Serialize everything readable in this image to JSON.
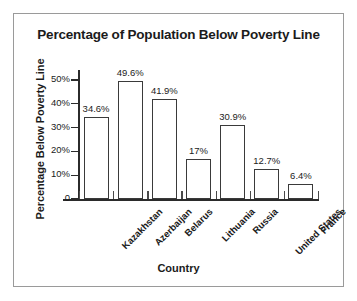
{
  "chart_data": {
    "type": "bar",
    "title": "Percentage of Population Below Poverty Line",
    "xlabel": "Country",
    "ylabel": "Percentage Below Poverty Line",
    "categories": [
      "Kazakhstan",
      "Azerbaijan",
      "Belarus",
      "Lithuania",
      "Russia",
      "United States",
      "France"
    ],
    "values": [
      34.6,
      49.6,
      41.9,
      17,
      30.9,
      12.7,
      6.4
    ],
    "value_labels": [
      "34.6%",
      "49.6%",
      "41.9%",
      "17%",
      "30.9%",
      "12.7%",
      "6.4%"
    ],
    "ylim": [
      0,
      55
    ],
    "yticks": [
      0,
      10,
      20,
      30,
      40,
      50
    ],
    "ytick_labels": [
      "0",
      "10%",
      "20%",
      "30%",
      "40%",
      "50%"
    ],
    "grid": false,
    "legend": false,
    "bar_fill_color": "#ffffff",
    "bar_edge_color": "#3a3a3a",
    "axis_color": "#2b2b2b",
    "text_color": "#1b1b1b",
    "frame_color": "#9a9a9a",
    "background_color": "#ffffff"
  }
}
